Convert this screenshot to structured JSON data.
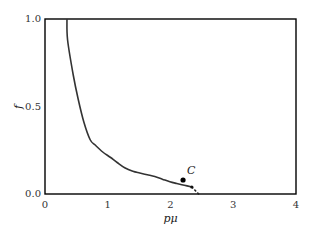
{
  "chart_data": {
    "type": "line",
    "title": "",
    "xlabel": "pμ",
    "ylabel": "f",
    "xlim": [
      0,
      4
    ],
    "ylim": [
      0,
      1
    ],
    "grid": false,
    "legend": null,
    "x_ticks": [
      "0",
      "1",
      "2",
      "3",
      "4"
    ],
    "y_ticks": [
      "0.0",
      "0.5",
      "1.0"
    ],
    "series": [
      {
        "name": "f(pμ)",
        "style": "solid",
        "color": "#333333",
        "x": [
          0.35,
          0.36,
          0.45,
          0.53,
          0.62,
          0.72,
          0.8,
          0.92,
          1.04,
          1.15,
          1.27,
          1.4,
          1.51,
          1.63,
          1.75,
          1.87,
          1.99,
          2.1,
          2.22,
          2.34
        ],
        "y": [
          1.0,
          0.88,
          0.68,
          0.54,
          0.41,
          0.31,
          0.28,
          0.24,
          0.21,
          0.18,
          0.15,
          0.13,
          0.12,
          0.11,
          0.1,
          0.085,
          0.07,
          0.06,
          0.05,
          0.04
        ]
      },
      {
        "name": "extension",
        "style": "dotted",
        "color": "#222222",
        "x": [
          2.34,
          2.45
        ],
        "y": [
          0.04,
          0.0
        ]
      }
    ],
    "annotations": [
      {
        "label": "C",
        "x": 2.2,
        "y": 0.08,
        "marker": "dot"
      }
    ]
  },
  "labels": {
    "x_axis": "pμ",
    "y_axis": "f",
    "point_c": "C",
    "x_tick_0": "0",
    "x_tick_1": "1",
    "x_tick_2": "2",
    "x_tick_3": "3",
    "x_tick_4": "4",
    "y_tick_0": "0.0",
    "y_tick_1": "0.5",
    "y_tick_2": "1.0"
  }
}
